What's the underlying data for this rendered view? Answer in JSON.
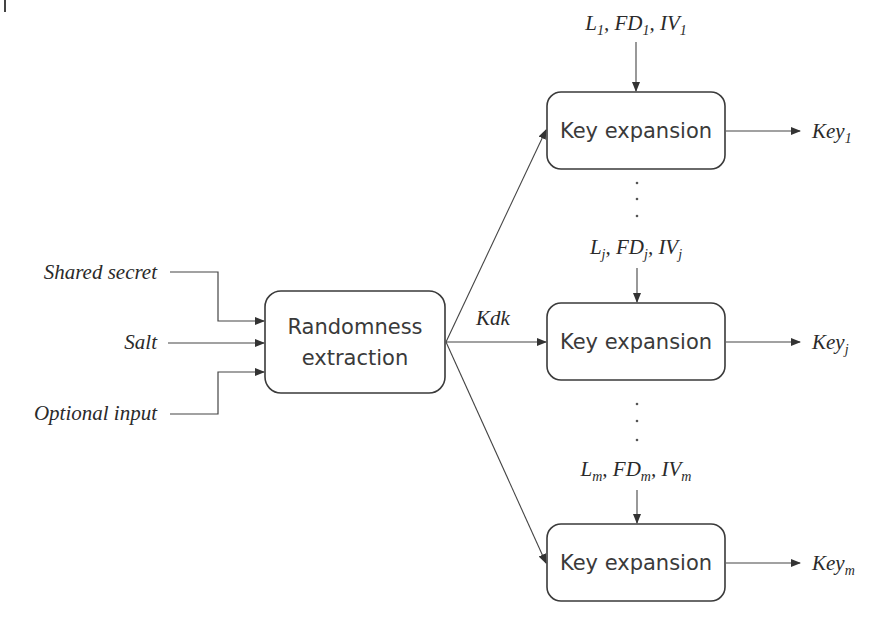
{
  "diagram": {
    "inputs": [
      {
        "label": "Shared secret"
      },
      {
        "label": "Salt"
      },
      {
        "label": "Optional input"
      }
    ],
    "extractor": {
      "line1": "Randomness",
      "line2": "extraction"
    },
    "intermediate_key": {
      "label": "Kdk"
    },
    "expansions": [
      {
        "box_label": "Key expansion",
        "params": {
          "L": "L",
          "L_sub": "1",
          "FD": "FD",
          "FD_sub": "1",
          "IV": "IV",
          "IV_sub": "1"
        },
        "output": {
          "base": "Key",
          "sub": "1"
        }
      },
      {
        "box_label": "Key expansion",
        "params": {
          "L": "L",
          "L_sub": "j",
          "FD": "FD",
          "FD_sub": "j",
          "IV": "IV",
          "IV_sub": "j"
        },
        "output": {
          "base": "Key",
          "sub": "j"
        }
      },
      {
        "box_label": "Key expansion",
        "params": {
          "L": "L",
          "L_sub": "m",
          "FD": "FD",
          "FD_sub": "m",
          "IV": "IV",
          "IV_sub": "m"
        },
        "output": {
          "base": "Key",
          "sub": "m"
        }
      }
    ],
    "separators": [
      ",",
      ","
    ],
    "ellipsis_dot": "·"
  },
  "colors": {
    "stroke": "#3a3a3a",
    "text": "#2a2a2a",
    "background": "#ffffff"
  }
}
